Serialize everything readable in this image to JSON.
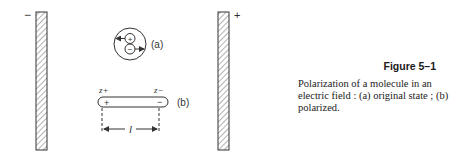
{
  "figure": {
    "number": "Figure 5–1",
    "caption": "Polarization of a molecule in an electric field : (a) original state ; (b) polarized.",
    "left_plate": {
      "sign": "−"
    },
    "right_plate": {
      "sign": "+"
    },
    "molecule_a": {
      "label": "(a)",
      "charges": [
        "+",
        "−"
      ]
    },
    "molecule_b": {
      "label": "(b)",
      "end_labels": [
        "z+",
        "z−"
      ],
      "charges": [
        "+",
        "−"
      ],
      "length_label": "l"
    }
  }
}
